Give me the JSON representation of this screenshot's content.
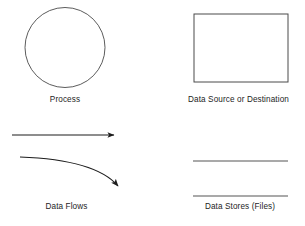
{
  "diagram": {
    "background_color": "#ffffff",
    "stroke_color": "#1d1d1d",
    "text_color": "#1d1d1d",
    "symbols": [
      {
        "id": "process",
        "shape": "circle",
        "label": "Process",
        "geometry": {
          "cx": 65,
          "cy": 47.5,
          "r": 40
        }
      },
      {
        "id": "data-source-destination",
        "shape": "rectangle",
        "label": "Data Source or Destination",
        "geometry": {
          "x": 194,
          "y": 14,
          "width": 94,
          "height": 68
        }
      },
      {
        "id": "data-flows",
        "shape": "arrows",
        "label": "Data Flows",
        "geometry": {
          "straight_arrow": {
            "x1": 12,
            "y1": 135,
            "x2": 118,
            "y2": 135
          },
          "curved_arrow": {
            "x1": 20,
            "y1": 157,
            "cx": 95,
            "cy": 160,
            "x2": 121,
            "y2": 191
          }
        }
      },
      {
        "id": "data-stores",
        "shape": "parallel-lines",
        "label": "Data Stores (Files)",
        "geometry": {
          "line_top": {
            "x1": 193,
            "y1": 161,
            "x2": 288,
            "y2": 161
          },
          "line_bottom": {
            "x1": 193,
            "y1": 196,
            "x2": 288,
            "y2": 196
          }
        }
      }
    ]
  }
}
